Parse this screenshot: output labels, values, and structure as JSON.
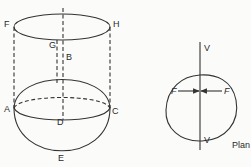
{
  "figure": {
    "left_view": {
      "points": {
        "F": "F",
        "H": "H",
        "G": "G",
        "B": "B",
        "A": "A",
        "C": "C",
        "D": "D",
        "E": "E"
      }
    },
    "plan_view": {
      "label": "Plan",
      "axis_top": "V",
      "axis_bottom": "V",
      "force_left": "F",
      "force_right": "F"
    }
  }
}
